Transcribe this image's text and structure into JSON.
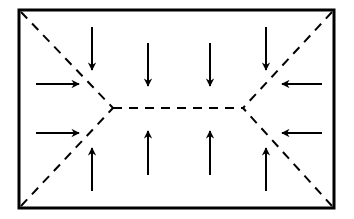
{
  "diagram": {
    "colors": {
      "stroke": "#000000",
      "background": "#ffffff"
    },
    "frame": {
      "x": 19,
      "y": 10,
      "width": 315,
      "height": 198
    },
    "ridge_junctions": {
      "left": [
        113,
        108
      ],
      "right": [
        243,
        108
      ]
    },
    "dashed_lines": [
      {
        "name": "diagonal-top-left",
        "from": [
          21,
          12
        ],
        "to": [
          113,
          108
        ]
      },
      {
        "name": "diagonal-bottom-left",
        "from": [
          21,
          206
        ],
        "to": [
          113,
          108
        ]
      },
      {
        "name": "diagonal-top-right",
        "from": [
          332,
          12
        ],
        "to": [
          243,
          108
        ]
      },
      {
        "name": "diagonal-bottom-right",
        "from": [
          332,
          206
        ],
        "to": [
          243,
          108
        ]
      },
      {
        "name": "center-ridge",
        "from": [
          113,
          108
        ],
        "to": [
          243,
          108
        ]
      }
    ],
    "arrows": [
      {
        "name": "arrow-down-1",
        "direction": "down",
        "from": [
          92,
          27
        ],
        "to": [
          92,
          70
        ]
      },
      {
        "name": "arrow-down-2",
        "direction": "down",
        "from": [
          148,
          43
        ],
        "to": [
          148,
          86
        ]
      },
      {
        "name": "arrow-down-3",
        "direction": "down",
        "from": [
          210,
          43
        ],
        "to": [
          210,
          86
        ]
      },
      {
        "name": "arrow-down-4",
        "direction": "down",
        "from": [
          266,
          27
        ],
        "to": [
          266,
          70
        ]
      },
      {
        "name": "arrow-right-1",
        "direction": "right",
        "from": [
          36,
          84
        ],
        "to": [
          79,
          84
        ]
      },
      {
        "name": "arrow-right-2",
        "direction": "right",
        "from": [
          36,
          133
        ],
        "to": [
          79,
          133
        ]
      },
      {
        "name": "arrow-left-1",
        "direction": "left",
        "from": [
          322,
          84
        ],
        "to": [
          282,
          84
        ]
      },
      {
        "name": "arrow-left-2",
        "direction": "left",
        "from": [
          322,
          133
        ],
        "to": [
          282,
          133
        ]
      },
      {
        "name": "arrow-up-1",
        "direction": "up",
        "from": [
          92,
          191
        ],
        "to": [
          92,
          148
        ]
      },
      {
        "name": "arrow-up-2",
        "direction": "up",
        "from": [
          148,
          175
        ],
        "to": [
          148,
          131
        ]
      },
      {
        "name": "arrow-up-3",
        "direction": "up",
        "from": [
          210,
          175
        ],
        "to": [
          210,
          131
        ]
      },
      {
        "name": "arrow-up-4",
        "direction": "up",
        "from": [
          266,
          191
        ],
        "to": [
          266,
          148
        ]
      }
    ]
  }
}
